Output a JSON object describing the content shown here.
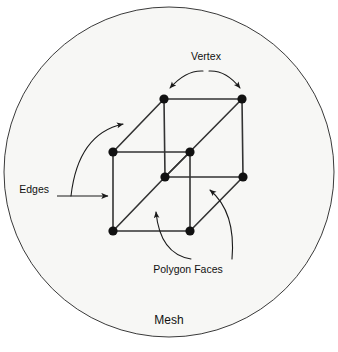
{
  "figure": {
    "caption": "Mesh",
    "background_color": "#ffffff",
    "disc_fill": "#f7f7f5",
    "disc_stroke": "#3a3a3a",
    "ink_color": "#111111"
  },
  "labels": {
    "vertex": "Vertex",
    "edges": "Edges",
    "polygon_faces": "Polygon Faces",
    "mesh": "Mesh"
  },
  "diagram_data": {
    "type": "diagram",
    "subject": "3D cube wireframe mesh with annotated parts",
    "disc": {
      "cx": 169,
      "cy": 172,
      "r": 165
    },
    "vertices": [
      {
        "id": "top-back-left",
        "x": 164,
        "y": 99,
        "r": 4.6
      },
      {
        "id": "top-back-right",
        "x": 242,
        "y": 99,
        "r": 4.6
      },
      {
        "id": "mid-back-left",
        "x": 113,
        "y": 152,
        "r": 4.6
      },
      {
        "id": "mid-back-right",
        "x": 190,
        "y": 152,
        "r": 4.6
      },
      {
        "id": "top-front-left",
        "x": 165,
        "y": 177,
        "r": 4.6
      },
      {
        "id": "top-front-right",
        "x": 243,
        "y": 177,
        "r": 4.6
      },
      {
        "id": "bot-front-left",
        "x": 113,
        "y": 231,
        "r": 4.6
      },
      {
        "id": "bot-front-right",
        "x": 190,
        "y": 231,
        "r": 4.6
      }
    ],
    "edges": [
      [
        "top-back-left",
        "top-back-right"
      ],
      [
        "top-back-left",
        "mid-back-left"
      ],
      [
        "top-back-right",
        "top-front-right"
      ],
      [
        "top-back-left",
        "top-front-left"
      ],
      [
        "top-back-right",
        "top-front-left"
      ],
      [
        "mid-back-left",
        "mid-back-right"
      ],
      [
        "mid-back-left",
        "bot-front-left"
      ],
      [
        "mid-back-right",
        "top-front-left"
      ],
      [
        "top-front-left",
        "top-front-right"
      ],
      [
        "top-front-left",
        "bot-front-left"
      ],
      [
        "top-front-left",
        "bot-front-right"
      ],
      [
        "bot-front-left",
        "bot-front-right"
      ],
      [
        "bot-front-right",
        "top-front-right"
      ]
    ],
    "annotations": [
      {
        "id": "vertex",
        "label": "Vertex",
        "label_x": 205,
        "label_y": 60,
        "arrow_style": "double-headed-arc"
      },
      {
        "id": "edges",
        "label": "Edges",
        "label_x": 58,
        "label_y": 196,
        "arrow_style": "straight-arrow-plus-curve"
      },
      {
        "id": "polygon-faces",
        "label": "Polygon Faces",
        "label_x": 188,
        "label_y": 273,
        "arrow_style": "two-curved-arrows"
      }
    ]
  }
}
